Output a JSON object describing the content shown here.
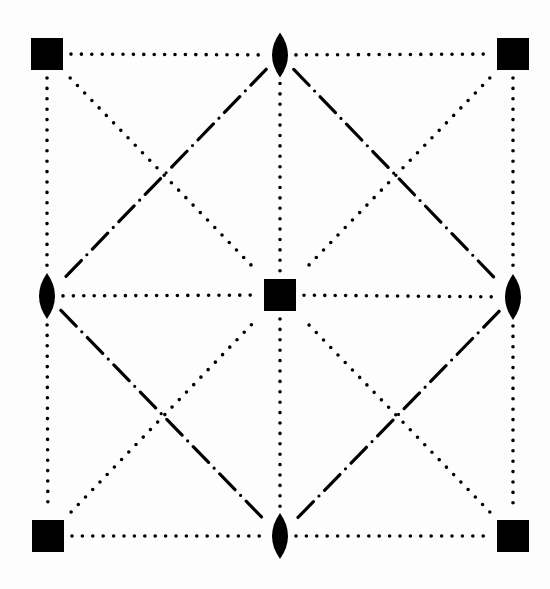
{
  "diagram": {
    "title": "",
    "background": "#fdfdfd",
    "ink_color": "#000000",
    "caption": "",
    "nodes": [
      {
        "id": "top-left-square",
        "shape": "square",
        "x": 47,
        "y": 54,
        "size": 32
      },
      {
        "id": "top-lens",
        "shape": "lens",
        "x": 280,
        "y": 55,
        "w": 16,
        "h": 45
      },
      {
        "id": "top-right-square",
        "shape": "square",
        "x": 513,
        "y": 54,
        "size": 32
      },
      {
        "id": "left-lens",
        "shape": "lens",
        "x": 47,
        "y": 296,
        "w": 16,
        "h": 46
      },
      {
        "id": "center-square",
        "shape": "square",
        "x": 280,
        "y": 295,
        "size": 32
      },
      {
        "id": "right-lens",
        "shape": "lens",
        "x": 513,
        "y": 297,
        "w": 16,
        "h": 46
      },
      {
        "id": "bottom-left-square",
        "shape": "square",
        "x": 48,
        "y": 536,
        "size": 32
      },
      {
        "id": "bottom-lens",
        "shape": "lens",
        "x": 280,
        "y": 536,
        "w": 16,
        "h": 46
      },
      {
        "id": "bottom-right-square",
        "shape": "square",
        "x": 513,
        "y": 536,
        "size": 32
      }
    ],
    "edges": [
      {
        "from": "top-left-square",
        "to": "top-lens",
        "style": "dotted"
      },
      {
        "from": "top-lens",
        "to": "top-right-square",
        "style": "dotted"
      },
      {
        "from": "left-lens",
        "to": "center-square",
        "style": "dotted"
      },
      {
        "from": "center-square",
        "to": "right-lens",
        "style": "dotted"
      },
      {
        "from": "bottom-left-square",
        "to": "bottom-lens",
        "style": "dotted"
      },
      {
        "from": "bottom-lens",
        "to": "bottom-right-square",
        "style": "dotted"
      },
      {
        "from": "top-left-square",
        "to": "left-lens",
        "style": "dotted"
      },
      {
        "from": "left-lens",
        "to": "bottom-left-square",
        "style": "dotted"
      },
      {
        "from": "top-lens",
        "to": "center-square",
        "style": "dotted"
      },
      {
        "from": "center-square",
        "to": "bottom-lens",
        "style": "dotted"
      },
      {
        "from": "top-right-square",
        "to": "right-lens",
        "style": "dotted"
      },
      {
        "from": "right-lens",
        "to": "bottom-right-square",
        "style": "dotted"
      },
      {
        "from": "top-left-square",
        "to": "center-square",
        "style": "dotted"
      },
      {
        "from": "top-right-square",
        "to": "center-square",
        "style": "dotted"
      },
      {
        "from": "bottom-left-square",
        "to": "center-square",
        "style": "dotted"
      },
      {
        "from": "bottom-right-square",
        "to": "center-square",
        "style": "dotted"
      },
      {
        "from": "top-lens",
        "to": "left-lens",
        "style": "dash-dot"
      },
      {
        "from": "top-lens",
        "to": "right-lens",
        "style": "dash-dot"
      },
      {
        "from": "left-lens",
        "to": "bottom-lens",
        "style": "dash-dot"
      },
      {
        "from": "right-lens",
        "to": "bottom-lens",
        "style": "dash-dot"
      }
    ],
    "line_styles": {
      "dotted": {
        "dash": "0 10.4",
        "width": 3.6,
        "cap": "round"
      },
      "dash-dot": {
        "dash": "22 8 0 8",
        "width": 3.2,
        "cap": "round"
      }
    },
    "legend": {
      "square_symbol": "filled square",
      "lens_symbol": "filled lens (vesica)",
      "dotted_line": "dotted line",
      "dash_dot_line": "dash-dot line"
    }
  }
}
